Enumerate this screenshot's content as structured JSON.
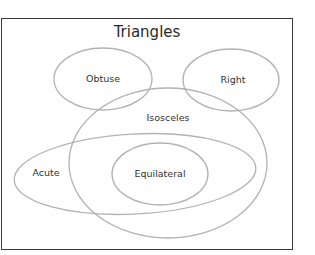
{
  "diagram": {
    "title": "Triangles",
    "stroke_color": "#b3b3b3",
    "border_color": "#3a3a3a",
    "text_color": "#333333",
    "sets": [
      {
        "id": "obtuse",
        "label": "Obtuse",
        "cx": 103,
        "cy": 79,
        "rx": 49,
        "ry": 31,
        "rotate": 0,
        "label_x": 103,
        "label_y": 82
      },
      {
        "id": "right",
        "label": "Right",
        "cx": 231,
        "cy": 80,
        "rx": 48,
        "ry": 31,
        "rotate": 0,
        "label_x": 233,
        "label_y": 83
      },
      {
        "id": "isosceles",
        "label": "Isosceles",
        "cx": 168,
        "cy": 163,
        "rx": 99,
        "ry": 75,
        "rotate": 0,
        "label_x": 168,
        "label_y": 121
      },
      {
        "id": "acute",
        "label": "Acute",
        "cx": 135,
        "cy": 174,
        "rx": 121,
        "ry": 40,
        "rotate": -3,
        "label_x": 46,
        "label_y": 176
      },
      {
        "id": "equilateral",
        "label": "Equilateral",
        "cx": 160,
        "cy": 174,
        "rx": 48,
        "ry": 31,
        "rotate": 0,
        "label_x": 160,
        "label_y": 177
      }
    ],
    "relationships": [
      "Equilateral is a subset of Isosceles",
      "Equilateral is a subset of Acute",
      "Acute overlaps Isosceles",
      "Obtuse overlaps Isosceles",
      "Right overlaps Isosceles",
      "Obtuse, Right, Acute are mutually disjoint"
    ]
  }
}
